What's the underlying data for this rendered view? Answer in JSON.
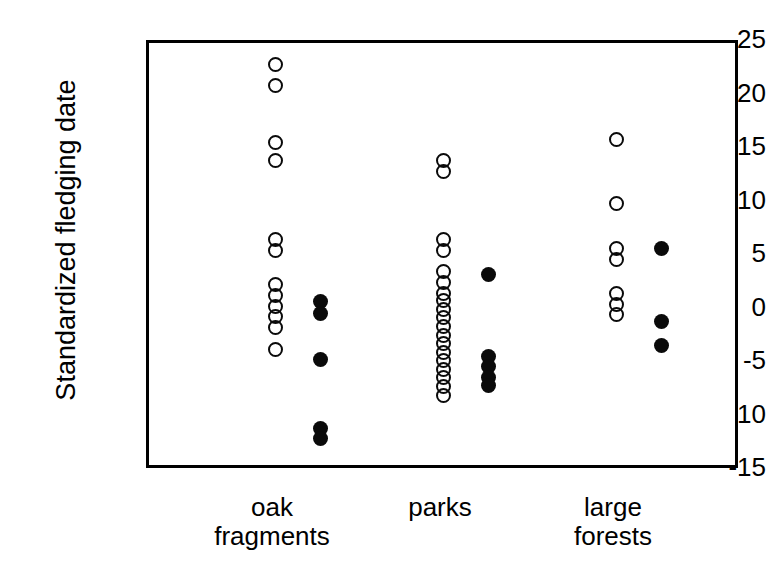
{
  "chart_data": {
    "type": "scatter",
    "title": "",
    "xlabel": "",
    "ylabel": "Standardized fledging date",
    "ylim": [
      -15,
      25
    ],
    "yticks": [
      25,
      20,
      15,
      10,
      5,
      0,
      -5,
      -10,
      -15
    ],
    "ytick_labels": [
      "25",
      "20",
      "15",
      "10",
      "5",
      "0",
      "-5",
      "-10",
      "-15"
    ],
    "grid": false,
    "legend": "none",
    "categories": [
      "oak fragments",
      "parks",
      "large forests"
    ],
    "category_labels": [
      "oak\nfragments",
      "parks",
      "large\nforests"
    ],
    "marker_styles": {
      "open": "open-circle",
      "filled": "filled-circle"
    },
    "colors": {
      "marker_edge": "#0a0a0a",
      "marker_fill": "#0a0a0a",
      "axis": "#000000",
      "background": "#ffffff"
    },
    "series": [
      {
        "name": "open",
        "marker": "open-circle",
        "points": [
          {
            "category": "oak fragments",
            "offset": 0,
            "y": 23.0
          },
          {
            "category": "oak fragments",
            "offset": 0,
            "y": 21.0
          },
          {
            "category": "oak fragments",
            "offset": 0,
            "y": 15.7
          },
          {
            "category": "oak fragments",
            "offset": 0,
            "y": 14.0
          },
          {
            "category": "oak fragments",
            "offset": 0,
            "y": 6.6
          },
          {
            "category": "oak fragments",
            "offset": 0,
            "y": 5.6
          },
          {
            "category": "oak fragments",
            "offset": 0,
            "y": 2.4
          },
          {
            "category": "oak fragments",
            "offset": 0,
            "y": 1.4
          },
          {
            "category": "oak fragments",
            "offset": 0,
            "y": 0.4
          },
          {
            "category": "oak fragments",
            "offset": 0,
            "y": -0.6
          },
          {
            "category": "oak fragments",
            "offset": 0,
            "y": -1.6
          },
          {
            "category": "oak fragments",
            "offset": 0,
            "y": -3.6
          },
          {
            "category": "parks",
            "offset": 0,
            "y": 14.0
          },
          {
            "category": "parks",
            "offset": 0,
            "y": 13.0
          },
          {
            "category": "parks",
            "offset": 0,
            "y": 6.6
          },
          {
            "category": "parks",
            "offset": 0,
            "y": 5.6
          },
          {
            "category": "parks",
            "offset": 0,
            "y": 3.6
          },
          {
            "category": "parks",
            "offset": 0,
            "y": 2.6
          },
          {
            "category": "parks",
            "offset": 0,
            "y": 1.6
          },
          {
            "category": "parks",
            "offset": 0,
            "y": 0.9
          },
          {
            "category": "parks",
            "offset": 0,
            "y": 0.1
          },
          {
            "category": "parks",
            "offset": 0,
            "y": -0.7
          },
          {
            "category": "parks",
            "offset": 0,
            "y": -1.5
          },
          {
            "category": "parks",
            "offset": 0,
            "y": -2.3
          },
          {
            "category": "parks",
            "offset": 0,
            "y": -3.1
          },
          {
            "category": "parks",
            "offset": 0,
            "y": -3.9
          },
          {
            "category": "parks",
            "offset": 0,
            "y": -4.7
          },
          {
            "category": "parks",
            "offset": 0,
            "y": -5.5
          },
          {
            "category": "parks",
            "offset": 0,
            "y": -6.3
          },
          {
            "category": "parks",
            "offset": 0,
            "y": -7.1
          },
          {
            "category": "parks",
            "offset": 0,
            "y": -7.9
          },
          {
            "category": "large forests",
            "offset": 0,
            "y": 16.0
          },
          {
            "category": "large forests",
            "offset": 0,
            "y": 10.0
          },
          {
            "category": "large forests",
            "offset": 0,
            "y": 5.8
          },
          {
            "category": "large forests",
            "offset": 0,
            "y": 4.8
          },
          {
            "category": "large forests",
            "offset": 0,
            "y": 1.6
          },
          {
            "category": "large forests",
            "offset": 0,
            "y": 0.6
          },
          {
            "category": "large forests",
            "offset": 0,
            "y": -0.4
          }
        ]
      },
      {
        "name": "filled",
        "marker": "filled-circle",
        "points": [
          {
            "category": "oak fragments",
            "offset": 1,
            "y": 0.8
          },
          {
            "category": "oak fragments",
            "offset": 1,
            "y": -0.3
          },
          {
            "category": "oak fragments",
            "offset": 1,
            "y": -4.6
          },
          {
            "category": "oak fragments",
            "offset": 1,
            "y": -11.0
          },
          {
            "category": "oak fragments",
            "offset": 1,
            "y": -12.0
          },
          {
            "category": "parks",
            "offset": 1,
            "y": 3.4
          },
          {
            "category": "parks",
            "offset": 1,
            "y": -4.3
          },
          {
            "category": "parks",
            "offset": 1,
            "y": -5.2
          },
          {
            "category": "parks",
            "offset": 1,
            "y": -6.3
          },
          {
            "category": "parks",
            "offset": 1,
            "y": -7.0
          },
          {
            "category": "large forests",
            "offset": 1,
            "y": 5.8
          },
          {
            "category": "large forests",
            "offset": 1,
            "y": -1.0
          },
          {
            "category": "large forests",
            "offset": 1,
            "y": -3.3
          }
        ]
      }
    ]
  },
  "layout": {
    "plot": {
      "left": 146,
      "top": 40,
      "width": 592,
      "height": 428
    },
    "category_x": [
      272,
      440,
      613
    ],
    "offset_px": 45,
    "category_label_y": 493
  }
}
